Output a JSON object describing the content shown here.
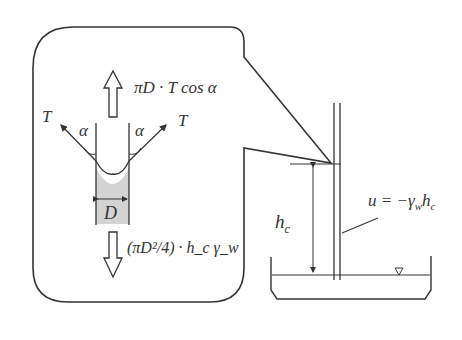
{
  "diagram": {
    "type": "capillary rise free-body diagram",
    "callout": {
      "upward_force_label": "πD · T cos α",
      "downward_force_label": "(πD²/4) · h_c γ_w",
      "tension_left_label": "T",
      "tension_right_label": "T",
      "angle_left_label": "α",
      "angle_right_label": "α",
      "diameter_label": "D"
    },
    "apparatus": {
      "height_label": "h",
      "height_subscript": "c",
      "pressure_label_main": "u = −γ",
      "pressure_label_sub_w": "w",
      "pressure_label_h": "h",
      "pressure_label_sub_c": "c",
      "water_level_symbol": "▽"
    },
    "colors": {
      "stroke": "#333333",
      "fill_water": "#d3d3d3",
      "background": "#ffffff"
    }
  }
}
